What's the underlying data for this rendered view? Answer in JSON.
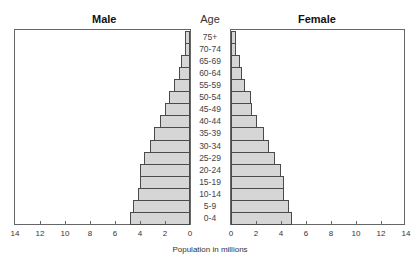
{
  "chart_data": {
    "type": "bar",
    "subtype": "population-pyramid",
    "title": "",
    "xlabel": "Population in millions",
    "ylabel": "Age",
    "left_panel_title": "Male",
    "right_panel_title": "Female",
    "categories": [
      "75+",
      "70-74",
      "65-69",
      "60-64",
      "55-59",
      "50-54",
      "45-49",
      "40-44",
      "35-39",
      "30-34",
      "25-29",
      "20-24",
      "15-19",
      "10-14",
      "5-9",
      "0-4"
    ],
    "series": [
      {
        "name": "Male",
        "values": [
          0.4,
          0.4,
          0.7,
          0.9,
          1.3,
          1.7,
          2.0,
          2.4,
          2.9,
          3.2,
          3.7,
          4.0,
          4.0,
          4.2,
          4.6,
          4.8
        ]
      },
      {
        "name": "Female",
        "values": [
          0.4,
          0.4,
          0.7,
          0.9,
          1.1,
          1.6,
          1.7,
          2.1,
          2.6,
          3.0,
          3.5,
          4.0,
          4.2,
          4.2,
          4.6,
          4.9
        ]
      }
    ],
    "xlim": [
      0,
      14
    ],
    "xticks": [
      0,
      2,
      4,
      6,
      8,
      10,
      12,
      14
    ],
    "grid": false,
    "legend": "panel titles"
  },
  "labels": {
    "male": "Male",
    "female": "Female",
    "age": "Age",
    "xlabel": "Population in millions"
  },
  "colors": {
    "bar_fill": "#d6d6d6",
    "bar_border": "#4a4a4a",
    "frame": "#666666"
  }
}
